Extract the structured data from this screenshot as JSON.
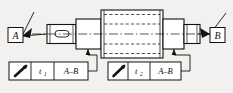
{
  "drawing": {
    "type": "gdt-shaft-runout",
    "background_color": "#f2f1ef",
    "line_color": "#15120f",
    "datum_labels": [
      {
        "id": "A",
        "text": "A",
        "position": "left"
      },
      {
        "id": "B",
        "text": "B",
        "position": "right"
      }
    ],
    "feature_control_frames": [
      {
        "id": "fcf-left",
        "symbol_name": "circular-runout-symbol",
        "symbol_text": "↗",
        "tolerance_value": "t",
        "tolerance_subscript": "1",
        "datum_reference": "A–B"
      },
      {
        "id": "fcf-right",
        "symbol_name": "circular-runout-symbol",
        "symbol_text": "↗",
        "tolerance_value": "t",
        "tolerance_subscript": "2",
        "datum_reference": "A–B"
      }
    ],
    "part": {
      "name": "stepped-shaft",
      "features": [
        "left-small-journal-with-keyway",
        "left-shoulder",
        "center-large-cylinder",
        "right-shoulder",
        "right-journal"
      ],
      "centerline": "dash-dot"
    }
  }
}
